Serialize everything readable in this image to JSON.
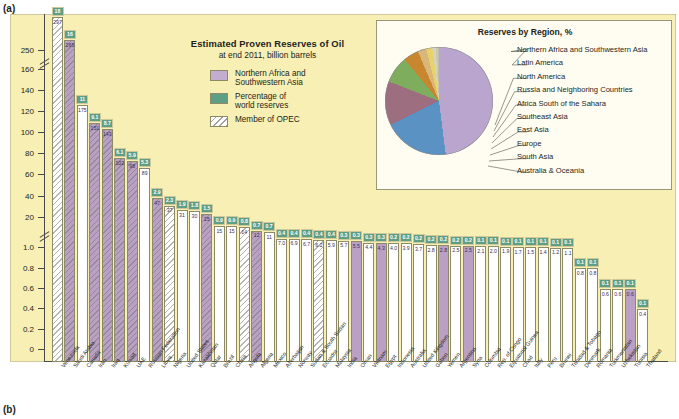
{
  "figure": {
    "panel_a_label": "(a)",
    "panel_b_label": "(b)"
  },
  "title": {
    "line1": "Estimated Proven Reserves of Oil",
    "line2": "at end 2011, billion barrels"
  },
  "legend": {
    "items": [
      {
        "key": "northern-africa-southwestern-asia",
        "label": "Northern Africa and\nSouthwestern Asia",
        "color": "#c2acd0"
      },
      {
        "key": "percentage-world-reserves",
        "label": "Percentage of\nworld reserves",
        "color": "#5e9e85"
      },
      {
        "key": "member-of-opec",
        "label": "Member of OPEC",
        "color": "#ffffff"
      }
    ],
    "label_nafsa_l1": "Northern Africa and",
    "label_nafsa_l2": "Southwestern Asia",
    "label_pct_l1": "Percentage of",
    "label_pct_l2": "world reserves",
    "label_opec": "Member of OPEC"
  },
  "pie_panel": {
    "title": "Reserves by Region, %",
    "legend": [
      "Northern Africa and Southwestern Asia",
      "Latin America",
      "North America",
      "Russia and Neighboring Countries",
      "Africa South of the Sahara",
      "Southeast Asia",
      "East Asia",
      "Europe",
      "South Asia",
      "Australia & Oceania"
    ]
  },
  "chart_data": {
    "type": "bar",
    "title": "Estimated Proven Reserves of Oil",
    "subtitle": "at end 2011, billion barrels",
    "xlabel": "",
    "ylabel": "billion barrels",
    "axis_ticks": [
      "250",
      "160",
      "140",
      "120",
      "100",
      "80",
      "60",
      "40",
      "20",
      "1.0",
      "0.8",
      "0.6",
      "0.4",
      "0.2",
      "0"
    ],
    "axis_breaks": [
      2,
      9
    ],
    "grid": false,
    "categories": [
      "Venezuela",
      "Saudi Arabia",
      "Canada",
      "Iran",
      "Iraq",
      "Kuwait",
      "UAE",
      "Russian Federation",
      "Libya",
      "Nigeria",
      "United States",
      "Kazakhstan",
      "Qatar",
      "Brazil",
      "China",
      "Angola",
      "Algeria",
      "Mexico",
      "Azerbaijan",
      "Norway",
      "Sudan & South Sudan",
      "Ecuador",
      "Malaysia",
      "India",
      "Oman",
      "Vietnam",
      "Egypt",
      "Indonesia",
      "Australia",
      "United Kingdom",
      "Gabon",
      "Yemen",
      "Argentina",
      "Syria",
      "Colombia",
      "Rep. of Congo",
      "Equatorial Guinea",
      "Chad",
      "Italy",
      "Peru",
      "Brunei",
      "Trinidad & Tobago",
      "Denmark",
      "Romania",
      "Turkmenistan",
      "Uzbekistan",
      "Tunisia",
      "Thailand"
    ],
    "values": [
      297,
      265,
      175,
      151,
      143,
      102,
      98,
      89,
      47,
      37,
      31,
      30,
      25,
      15,
      15,
      14,
      12,
      11,
      7.0,
      6.9,
      6.7,
      6.2,
      5.9,
      5.7,
      5.5,
      4.4,
      4.3,
      4.0,
      3.9,
      3.7,
      2.8,
      2.8,
      2.5,
      2.5,
      2.1,
      2.0,
      1.9,
      1.7,
      1.5,
      1.4,
      1.2,
      1.1,
      0.8,
      0.8,
      0.6,
      0.6,
      0.6,
      0.4
    ],
    "percent_of_world": [
      18,
      16,
      11,
      "9.1",
      "8.7",
      "6.1",
      "5.9",
      "5.3",
      "2.9",
      "2.3",
      "1.9",
      "1.8",
      "1.5",
      "0.9",
      "0.9",
      "0.8",
      "0.7",
      "0.7",
      "0.4",
      "0.4",
      "0.4",
      "0.4",
      "0.4",
      "0.3",
      "0.3",
      "0.3",
      "0.3",
      "0.2",
      "0.2",
      "0.2",
      "0.2",
      "0.2",
      "0.2",
      "0.2",
      "0.1",
      "0.1",
      "0.1",
      "0.1",
      "0.1",
      "0.1",
      "0.1",
      "0.1",
      "0.1",
      "0.1",
      "0.1",
      "0.1",
      "0.1",
      "0.1"
    ],
    "is_nafsa": [
      false,
      true,
      false,
      true,
      true,
      true,
      true,
      false,
      true,
      false,
      false,
      false,
      true,
      false,
      false,
      false,
      true,
      false,
      false,
      false,
      false,
      false,
      false,
      false,
      true,
      false,
      true,
      false,
      false,
      false,
      false,
      true,
      false,
      true,
      false,
      false,
      false,
      false,
      false,
      false,
      false,
      false,
      false,
      false,
      false,
      false,
      true,
      false
    ],
    "is_opec": [
      true,
      true,
      false,
      true,
      true,
      true,
      true,
      false,
      true,
      true,
      false,
      false,
      true,
      false,
      false,
      true,
      true,
      false,
      false,
      false,
      false,
      true,
      false,
      false,
      false,
      false,
      false,
      false,
      false,
      false,
      false,
      false,
      false,
      false,
      false,
      false,
      false,
      false,
      false,
      false,
      false,
      false,
      false,
      false,
      false,
      false,
      false,
      false
    ],
    "bar_value_labels": [
      "297",
      "265",
      "175",
      "151",
      "143",
      "102",
      "98",
      "89",
      "47",
      "37",
      "31",
      "30",
      "25",
      "15",
      "15",
      "14",
      "12",
      "11",
      "7.0",
      "6.9",
      "6.7",
      "6.2",
      "5.9",
      "5.7",
      "5.5",
      "4.4",
      "4.3",
      "4.0",
      "3.9",
      "3.7",
      "2.8",
      "2.8",
      "2.5",
      "2.5",
      "2.1",
      "2.0",
      "1.9",
      "1.7",
      "1.5",
      "1.4",
      "1.2",
      "1.1",
      "0.8",
      "0.8",
      "0.6",
      "0.6",
      "0.6",
      "0.4"
    ]
  },
  "pie_chart_data": {
    "type": "pie",
    "title": "Reserves by Region, %",
    "labels": [
      "Northern Africa and Southwestern Asia",
      "Latin America",
      "North America",
      "Russia and Neighboring Countries",
      "Africa South of the Sahara",
      "Southeast Asia",
      "East Asia",
      "Europe",
      "South Asia",
      "Australia & Oceania"
    ],
    "values": [
      48.0,
      19.7,
      13.2,
      8.1,
      4.6,
      2.6,
      1.8,
      1.0,
      0.6,
      0.4
    ],
    "colors": [
      "#b9a5cd",
      "#5b92c4",
      "#9c6e80",
      "#7fad5e",
      "#c8872f",
      "#d9b77a",
      "#e8d26a",
      "#d4d4c0",
      "#c9c9b4",
      "#bdbdaa"
    ]
  }
}
